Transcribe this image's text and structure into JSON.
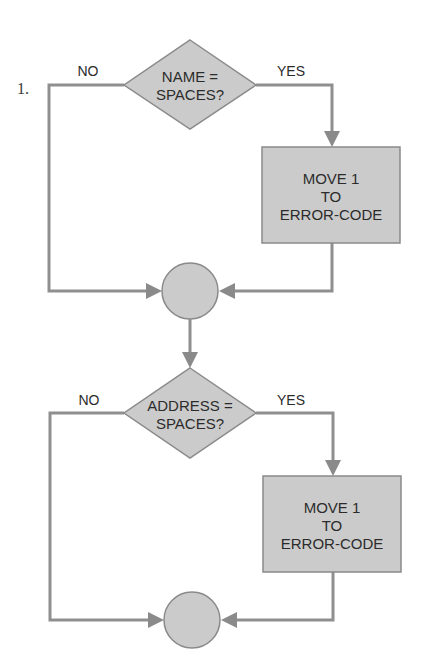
{
  "figure": {
    "number_label": "1.",
    "colors": {
      "line": "#8f8f8f",
      "shape_fill": "#cbcbcb",
      "shape_stroke": "#8a8a8a",
      "text": "#2b2b2b",
      "background": "#ffffff"
    },
    "blocks": [
      {
        "decision": {
          "line1": "NAME =",
          "line2": "SPACES?"
        },
        "no_label": "NO",
        "yes_label": "YES",
        "process": {
          "line1": "MOVE 1",
          "line2": "TO",
          "line3": "ERROR-CODE"
        },
        "connector": "join"
      },
      {
        "decision": {
          "line1": "ADDRESS =",
          "line2": "SPACES?"
        },
        "no_label": "NO",
        "yes_label": "YES",
        "process": {
          "line1": "MOVE 1",
          "line2": "TO",
          "line3": "ERROR-CODE"
        },
        "connector": "join"
      }
    ]
  }
}
